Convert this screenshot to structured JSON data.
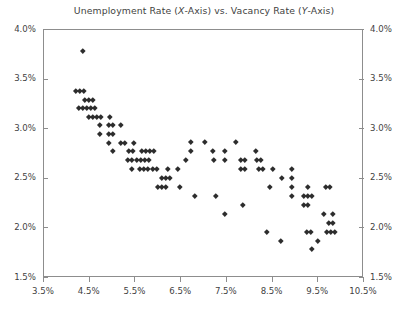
{
  "chart_data": {
    "type": "scatter",
    "title": "Unemployment Rate (X-Axis) vs. Vacancy Rate (Y-Axis)",
    "title_parts": {
      "before_x": "Unemployment Rate (",
      "x_italic": "X",
      "after_x": "-Axis) vs. Vacancy Rate (",
      "y_italic": "Y",
      "after_y": "-Axis)"
    },
    "xlabel": "",
    "ylabel": "",
    "xlim": [
      3.5,
      10.5
    ],
    "ylim": [
      1.5,
      4.0
    ],
    "x_ticks": [
      3.5,
      4.5,
      5.5,
      6.5,
      7.5,
      8.5,
      9.5,
      10.5
    ],
    "x_tick_labels": [
      "3.5%",
      "4.5%",
      "5.5%",
      "6.5%",
      "7.5%",
      "8.5%",
      "9.5%",
      "10.5%"
    ],
    "y_ticks": [
      1.5,
      2.0,
      2.5,
      3.0,
      3.5,
      4.0
    ],
    "y_tick_labels": [
      "1.5%",
      "2.0%",
      "2.5%",
      "3.0%",
      "3.5%",
      "4.0%"
    ],
    "y_axis_left": true,
    "y_axis_right": true,
    "grid": false,
    "legend": null,
    "marker": "diamond",
    "marker_color": "#2d2d2d",
    "marker_size_px": 3.6,
    "series": [
      {
        "name": "Beveridge curve observations",
        "points": [
          [
            4.35,
            3.79
          ],
          [
            4.2,
            3.39
          ],
          [
            4.29,
            3.39
          ],
          [
            4.38,
            3.39
          ],
          [
            4.39,
            3.3
          ],
          [
            4.48,
            3.3
          ],
          [
            4.57,
            3.3
          ],
          [
            4.26,
            3.22
          ],
          [
            4.35,
            3.22
          ],
          [
            4.44,
            3.22
          ],
          [
            4.53,
            3.22
          ],
          [
            4.62,
            3.22
          ],
          [
            4.47,
            3.13
          ],
          [
            4.56,
            3.13
          ],
          [
            4.65,
            3.13
          ],
          [
            4.74,
            3.13
          ],
          [
            4.93,
            3.13
          ],
          [
            4.73,
            3.04
          ],
          [
            4.91,
            3.04
          ],
          [
            5.0,
            3.04
          ],
          [
            5.19,
            3.04
          ],
          [
            4.73,
            2.95
          ],
          [
            4.91,
            2.95
          ],
          [
            5.0,
            2.95
          ],
          [
            4.91,
            2.86
          ],
          [
            5.17,
            2.86
          ],
          [
            5.26,
            2.86
          ],
          [
            5.46,
            2.86
          ],
          [
            6.72,
            2.87
          ],
          [
            7.02,
            2.87
          ],
          [
            7.7,
            2.87
          ],
          [
            5.0,
            2.78
          ],
          [
            5.36,
            2.78
          ],
          [
            5.45,
            2.78
          ],
          [
            5.63,
            2.78
          ],
          [
            5.72,
            2.78
          ],
          [
            5.81,
            2.78
          ],
          [
            5.9,
            2.78
          ],
          [
            6.72,
            2.78
          ],
          [
            7.2,
            2.78
          ],
          [
            7.45,
            2.78
          ],
          [
            8.13,
            2.78
          ],
          [
            5.34,
            2.69
          ],
          [
            5.43,
            2.69
          ],
          [
            5.52,
            2.69
          ],
          [
            5.61,
            2.69
          ],
          [
            5.7,
            2.69
          ],
          [
            5.79,
            2.69
          ],
          [
            6.61,
            2.69
          ],
          [
            7.22,
            2.69
          ],
          [
            7.45,
            2.69
          ],
          [
            7.8,
            2.69
          ],
          [
            7.89,
            2.69
          ],
          [
            8.15,
            2.69
          ],
          [
            8.24,
            2.69
          ],
          [
            5.42,
            2.6
          ],
          [
            5.6,
            2.6
          ],
          [
            5.69,
            2.6
          ],
          [
            5.78,
            2.6
          ],
          [
            5.87,
            2.6
          ],
          [
            5.96,
            2.6
          ],
          [
            6.2,
            2.6
          ],
          [
            6.42,
            2.6
          ],
          [
            7.8,
            2.6
          ],
          [
            7.89,
            2.6
          ],
          [
            8.2,
            2.6
          ],
          [
            8.29,
            2.6
          ],
          [
            8.5,
            2.6
          ],
          [
            8.92,
            2.6
          ],
          [
            6.07,
            2.51
          ],
          [
            6.16,
            2.51
          ],
          [
            6.25,
            2.51
          ],
          [
            8.7,
            2.51
          ],
          [
            8.92,
            2.51
          ],
          [
            5.98,
            2.42
          ],
          [
            6.07,
            2.42
          ],
          [
            6.16,
            2.42
          ],
          [
            6.48,
            2.42
          ],
          [
            8.45,
            2.42
          ],
          [
            8.92,
            2.42
          ],
          [
            9.27,
            2.42
          ],
          [
            9.66,
            2.42
          ],
          [
            9.75,
            2.42
          ],
          [
            6.8,
            2.33
          ],
          [
            7.25,
            2.33
          ],
          [
            8.92,
            2.33
          ],
          [
            9.18,
            2.33
          ],
          [
            9.27,
            2.33
          ],
          [
            9.36,
            2.33
          ],
          [
            7.85,
            2.24
          ],
          [
            9.18,
            2.24
          ],
          [
            9.27,
            2.24
          ],
          [
            7.45,
            2.15
          ],
          [
            9.63,
            2.15
          ],
          [
            9.81,
            2.15
          ],
          [
            9.72,
            2.06
          ],
          [
            9.81,
            2.06
          ],
          [
            8.38,
            1.97
          ],
          [
            9.24,
            1.97
          ],
          [
            9.33,
            1.97
          ],
          [
            9.68,
            1.97
          ],
          [
            9.77,
            1.97
          ],
          [
            9.86,
            1.97
          ],
          [
            8.68,
            1.88
          ],
          [
            9.48,
            1.88
          ],
          [
            9.36,
            1.79
          ]
        ]
      }
    ]
  }
}
